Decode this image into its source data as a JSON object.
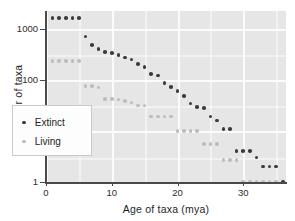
{
  "chart_data": {
    "type": "scatter",
    "title": "",
    "xlabel": "Age of taxa (mya)",
    "ylabel": "Number of taxa",
    "xlim": [
      0,
      36.5
    ],
    "ylim": [
      1,
      2200
    ],
    "yscale": "log",
    "xscale": "linear",
    "grid": true,
    "xticks": [
      0,
      10,
      20,
      30
    ],
    "xticklabels": [
      "0",
      "10",
      "20",
      "30"
    ],
    "yticks": [
      1,
      10,
      100,
      1000
    ],
    "yticklabels": [
      "1",
      "10",
      "100",
      "1000"
    ],
    "legend_position": "lower-left-inside",
    "series": [
      {
        "name": "Extinct",
        "color": "#3c3c3c",
        "x": [
          1,
          2,
          3,
          4,
          5,
          6,
          7,
          8,
          9,
          10,
          11,
          12,
          13,
          14,
          15,
          16,
          17,
          18,
          19,
          20,
          21,
          22,
          23,
          24,
          25,
          26,
          27,
          28,
          29,
          30,
          31,
          32,
          33,
          34,
          35,
          36
        ],
        "y": [
          1600,
          1600,
          1600,
          1600,
          1600,
          700,
          480,
          400,
          350,
          330,
          300,
          270,
          250,
          200,
          175,
          130,
          120,
          85,
          72,
          60,
          48,
          34,
          29,
          28,
          19,
          16,
          11,
          11,
          4,
          4,
          4,
          3,
          2,
          2,
          2,
          1
        ]
      },
      {
        "name": "Living",
        "color": "#bdbdbd",
        "x": [
          1,
          2,
          3,
          4,
          5,
          6,
          7,
          8,
          9,
          10,
          11,
          12,
          13,
          14,
          15,
          16,
          17,
          18,
          19,
          20,
          21,
          22,
          23,
          24,
          25,
          26,
          27,
          28,
          29,
          30,
          31,
          32,
          33,
          34,
          35
        ],
        "y": [
          230,
          230,
          230,
          230,
          230,
          76,
          76,
          70,
          42,
          42,
          41,
          38,
          36,
          31,
          31,
          19,
          19,
          19,
          19,
          10,
          10,
          10,
          10,
          5.5,
          5.5,
          5.5,
          2.7,
          2.7,
          2.7,
          1,
          1,
          1,
          1,
          1,
          1
        ]
      }
    ]
  },
  "legend": {
    "items": [
      {
        "label": "Extinct",
        "color": "#3c3c3c"
      },
      {
        "label": "Living",
        "color": "#bdbdbd"
      }
    ]
  },
  "colors": {
    "plot_background": "#e6e6e6",
    "gridline": "#fbfbfb",
    "axis": "#4a4a4a",
    "text": "#1e1e1e",
    "extinct": "#3c3c3c",
    "living": "#bdbdbd"
  }
}
